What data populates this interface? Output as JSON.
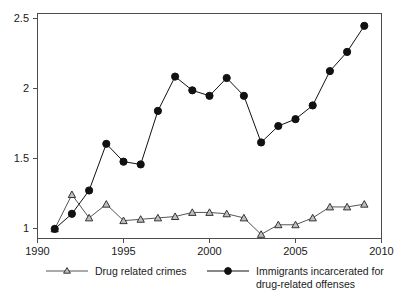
{
  "chart_data": {
    "type": "line",
    "title": "",
    "xlabel": "",
    "ylabel": "",
    "xlim": [
      1990,
      2010
    ],
    "ylim": [
      0.93,
      2.57
    ],
    "xticks": [
      1990,
      1995,
      2000,
      2005,
      2010
    ],
    "xtick_labels": [
      "1990",
      "1995",
      "2000",
      "2005",
      "2010"
    ],
    "yticks": [
      1,
      1.5,
      2,
      2.5
    ],
    "ytick_labels": [
      "1",
      "1.5",
      "2",
      "2.5"
    ],
    "grid": false,
    "legend_position": "below",
    "x": [
      1991,
      1992,
      1993,
      1994,
      1995,
      1996,
      1997,
      1998,
      1999,
      2000,
      2001,
      2002,
      2003,
      2004,
      2005,
      2006,
      2007,
      2008,
      2009
    ],
    "series": [
      {
        "name": "Drug related crimes",
        "marker": "triangle",
        "color": "#555555",
        "values": [
          1.0,
          1.25,
          1.08,
          1.18,
          1.06,
          1.07,
          1.08,
          1.09,
          1.12,
          1.12,
          1.11,
          1.08,
          0.96,
          1.03,
          1.03,
          1.08,
          1.16,
          1.16,
          1.18
        ]
      },
      {
        "name": "Immigrants incarcerated for drug-related offenses",
        "marker": "circle",
        "color": "#111111",
        "values": [
          1.0,
          1.11,
          1.28,
          1.62,
          1.49,
          1.47,
          1.86,
          2.11,
          2.01,
          1.97,
          2.1,
          1.97,
          1.63,
          1.75,
          1.8,
          1.9,
          2.15,
          2.29,
          2.48
        ]
      }
    ],
    "annotations": []
  },
  "legend": {
    "entries": [
      {
        "label": "Drug related crimes",
        "label_line1": "Drug related crimes",
        "label_line2": "",
        "marker": "triangle-marker-icon"
      },
      {
        "label": "Immigrants incarcerated for drug-related offenses",
        "label_line1": "Immigrants incarcerated for",
        "label_line2": "drug-related offenses",
        "marker": "circle-marker-icon"
      }
    ]
  },
  "colors": {
    "axis": "#4d4d4d",
    "triangle_series": "#555555",
    "circle_series": "#111111",
    "background": "#ffffff"
  }
}
